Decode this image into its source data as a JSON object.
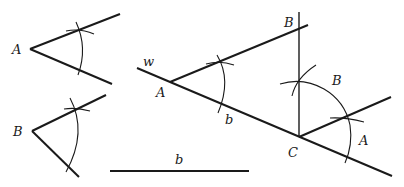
{
  "figure": {
    "labels": {
      "given_angle_a": "A",
      "given_angle_b": "B",
      "segment_b": "b",
      "line_w": "w",
      "vertex_a": "A",
      "side_b": "b",
      "vertex_b_top": "B",
      "angle_b_mark": "B",
      "vertex_c": "C",
      "angle_a_mark": "A"
    }
  }
}
